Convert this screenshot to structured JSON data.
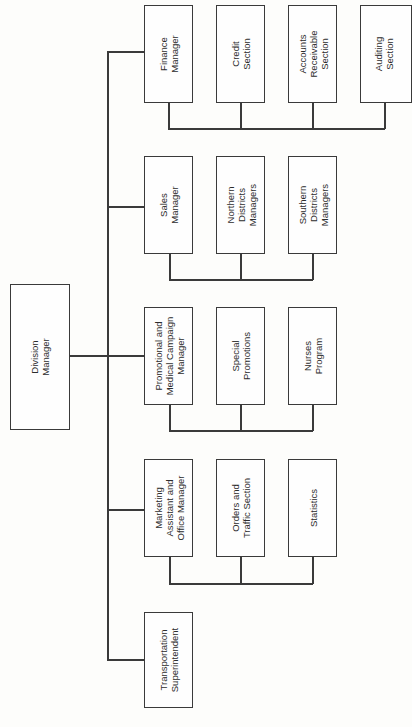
{
  "chart": {
    "type": "organization-chart",
    "orientation": "rotated 90 degrees counter-clockwise",
    "root": {
      "label": "Division\nManager"
    },
    "departments": [
      {
        "head": "Finance\nManager",
        "units": [
          "Credit\nSection",
          "Accounts\nReceivable\nSection",
          "Auditing\nSection"
        ]
      },
      {
        "head": "Sales\nManager",
        "units": [
          "Northern\nDistricts\nManagers",
          "Southern\nDistricts\nManagers"
        ]
      },
      {
        "head": "Promotional and\nMedical Campaign\nManager",
        "units": [
          "Special\nPromotions",
          "Nurses\nProgram"
        ]
      },
      {
        "head": "Marketing\nAssistant and\nOffice Manager",
        "units": [
          "Orders and\nTraffic Section",
          "Statistics"
        ]
      },
      {
        "head": "Transportation\nSuperintendent",
        "units": []
      }
    ]
  },
  "colors": {
    "line": "#3a3a3a",
    "background": "#fdfdfb"
  }
}
